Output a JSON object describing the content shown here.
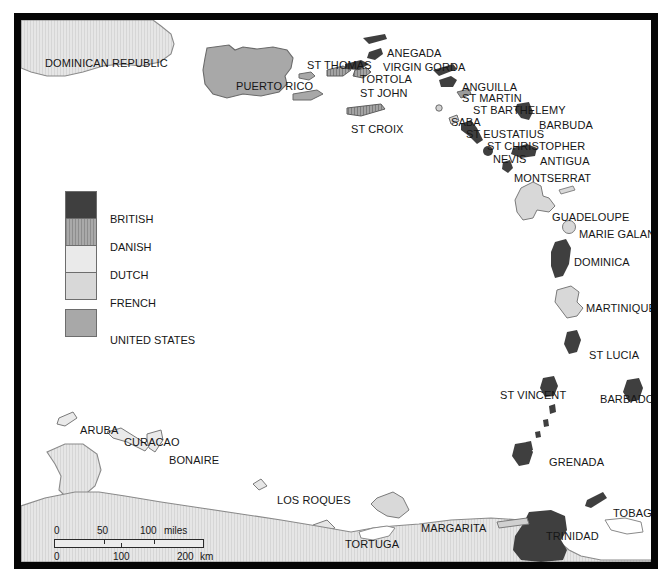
{
  "map": {
    "title": "Caribbean colonial possessions map",
    "legend": {
      "items": [
        {
          "label": "BRITISH",
          "color": "#3f3f3f",
          "pattern": "solid"
        },
        {
          "label": "DANISH",
          "color": "#9a9a9a",
          "pattern": "hatch"
        },
        {
          "label": "DUTCH",
          "color": "#eaeaea",
          "pattern": "solid"
        },
        {
          "label": "FRENCH",
          "color": "#d8d8d8",
          "pattern": "solid"
        },
        {
          "label": "UNITED STATES",
          "color": "#a8a8a8",
          "pattern": "solid"
        }
      ]
    },
    "scale": {
      "miles": {
        "unit": "miles",
        "ticks": [
          "0",
          "50",
          "100"
        ]
      },
      "km": {
        "unit": "km",
        "ticks": [
          "0",
          "100",
          "200"
        ]
      }
    },
    "labels": [
      {
        "name": "dominican-republic",
        "text": "DOMINICAN REPUBLIC",
        "x": 24,
        "y": 38
      },
      {
        "name": "puerto-rico",
        "text": "PUERTO RICO",
        "x": 215,
        "y": 61
      },
      {
        "name": "st-thomas",
        "text": "ST THOMAS",
        "x": 286,
        "y": 40
      },
      {
        "name": "anegada",
        "text": "ANEGADA",
        "x": 366,
        "y": 28
      },
      {
        "name": "virgin-gorda",
        "text": "VIRGIN GORDA",
        "x": 362,
        "y": 42
      },
      {
        "name": "tortola",
        "text": "TORTOLA",
        "x": 339,
        "y": 54
      },
      {
        "name": "st-john",
        "text": "ST JOHN",
        "x": 339,
        "y": 68
      },
      {
        "name": "st-croix",
        "text": "ST CROIX",
        "x": 330,
        "y": 104
      },
      {
        "name": "anguilla",
        "text": "ANGUILLA",
        "x": 441,
        "y": 62
      },
      {
        "name": "st-martin",
        "text": "ST MARTIN",
        "x": 441,
        "y": 73
      },
      {
        "name": "st-barthelemy",
        "text": "ST BARTHELEMY",
        "x": 452,
        "y": 85
      },
      {
        "name": "saba",
        "text": "SABA",
        "x": 430,
        "y": 97
      },
      {
        "name": "st-eustatius",
        "text": "ST EUSTATIUS",
        "x": 445,
        "y": 109
      },
      {
        "name": "barbuda",
        "text": "BARBUDA",
        "x": 518,
        "y": 100
      },
      {
        "name": "st-christopher",
        "text": "ST CHRISTOPHER",
        "x": 466,
        "y": 121
      },
      {
        "name": "nevis",
        "text": "NEVIS",
        "x": 472,
        "y": 134
      },
      {
        "name": "antigua",
        "text": "ANTIGUA",
        "x": 519,
        "y": 136
      },
      {
        "name": "montserrat",
        "text": "MONTSERRAT",
        "x": 493,
        "y": 153
      },
      {
        "name": "guadeloupe",
        "text": "GUADELOUPE",
        "x": 531,
        "y": 192
      },
      {
        "name": "marie-galante",
        "text": "MARIE GALANTE",
        "x": 558,
        "y": 209
      },
      {
        "name": "dominica",
        "text": "DOMINICA",
        "x": 553,
        "y": 237
      },
      {
        "name": "martinique",
        "text": "MARTINIQUE",
        "x": 565,
        "y": 283
      },
      {
        "name": "st-lucia",
        "text": "ST LUCIA",
        "x": 568,
        "y": 330
      },
      {
        "name": "st-vincent",
        "text": "ST VINCENT",
        "x": 479,
        "y": 370
      },
      {
        "name": "barbados",
        "text": "BARBADOS",
        "x": 579,
        "y": 374
      },
      {
        "name": "grenada",
        "text": "GRENADA",
        "x": 528,
        "y": 437
      },
      {
        "name": "aruba",
        "text": "ARUBA",
        "x": 59,
        "y": 405
      },
      {
        "name": "curacao",
        "text": "CURACAO",
        "x": 103,
        "y": 417
      },
      {
        "name": "bonaire",
        "text": "BONAIRE",
        "x": 148,
        "y": 435
      },
      {
        "name": "los-roques",
        "text": "LOS ROQUES",
        "x": 256,
        "y": 475
      },
      {
        "name": "margarita",
        "text": "MARGARITA",
        "x": 400,
        "y": 503
      },
      {
        "name": "tortuga",
        "text": "TORTUGA",
        "x": 324,
        "y": 519
      },
      {
        "name": "trinidad",
        "text": "TRINIDAD",
        "x": 525,
        "y": 511
      },
      {
        "name": "tobago",
        "text": "TOBAGO",
        "x": 592,
        "y": 488
      },
      {
        "name": "venezuela",
        "text": "VENEZUELA",
        "x": 385,
        "y": 551
      }
    ]
  }
}
